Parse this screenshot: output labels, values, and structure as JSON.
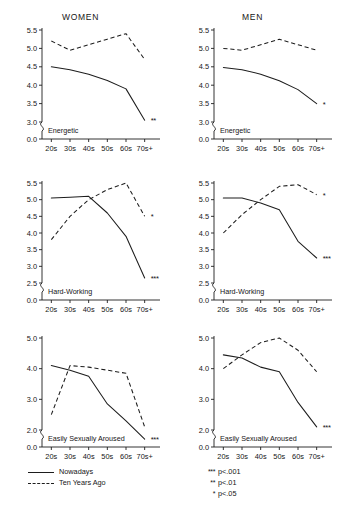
{
  "figure": {
    "column_titles": [
      "WOMEN",
      "MEN"
    ],
    "legend": [
      {
        "label": "Nowadays",
        "style": "solid"
      },
      {
        "label": "Ten Years Ago",
        "style": "dashed"
      }
    ],
    "significance_notes": [
      {
        "stars": "***",
        "label": "p<.001"
      },
      {
        "stars": "**",
        "label": "p<.01"
      },
      {
        "stars": "*",
        "label": "p<.05"
      }
    ]
  },
  "chart_data": [
    {
      "type": "line",
      "title": "WOMEN",
      "panel_label": "Energetic",
      "xlabel": "",
      "ylabel": "",
      "categories": [
        "20s",
        "30s",
        "40s",
        "50s",
        "60s",
        "70s+"
      ],
      "yticks": [
        "5.5",
        "5.0",
        "4.5",
        "4.0",
        "3.5",
        "3.0",
        "0.0"
      ],
      "ylim": [
        3.0,
        5.5
      ],
      "axis_break": true,
      "grid": false,
      "legend_position": "figure-bottom-left",
      "significance": "**",
      "series": [
        {
          "name": "Nowadays",
          "style": "solid",
          "values": [
            4.5,
            4.42,
            4.3,
            4.13,
            3.9,
            3.05
          ]
        },
        {
          "name": "Ten Years Ago",
          "style": "dashed",
          "values": [
            5.2,
            4.95,
            5.1,
            5.25,
            5.4,
            4.7
          ]
        }
      ]
    },
    {
      "type": "line",
      "title": "MEN",
      "panel_label": "Energetic",
      "xlabel": "",
      "ylabel": "",
      "categories": [
        "20s",
        "30s",
        "40s",
        "50s",
        "60s",
        "70s+"
      ],
      "yticks": [
        "5.5",
        "5.0",
        "4.5",
        "4.0",
        "3.5",
        "3.0",
        "0.0"
      ],
      "ylim": [
        3.0,
        5.5
      ],
      "axis_break": true,
      "grid": false,
      "legend_position": "figure-bottom-left",
      "significance": "*",
      "series": [
        {
          "name": "Nowadays",
          "style": "solid",
          "values": [
            4.48,
            4.42,
            4.3,
            4.12,
            3.88,
            3.5
          ]
        },
        {
          "name": "Ten Years Ago",
          "style": "dashed",
          "values": [
            5.0,
            4.95,
            5.1,
            5.25,
            5.1,
            4.95
          ]
        }
      ]
    },
    {
      "type": "line",
      "title": "WOMEN",
      "panel_label": "Hard-Working",
      "xlabel": "",
      "ylabel": "",
      "categories": [
        "20s",
        "30s",
        "40s",
        "50s",
        "60s",
        "70s+"
      ],
      "yticks": [
        "5.5",
        "5.0",
        "4.5",
        "4.0",
        "3.5",
        "3.0",
        "2.5",
        "0.0"
      ],
      "ylim": [
        2.5,
        5.5
      ],
      "axis_break": true,
      "grid": false,
      "legend_position": "figure-bottom-left",
      "significance": "***",
      "significance_dashed": "*",
      "series": [
        {
          "name": "Nowadays",
          "style": "solid",
          "values": [
            5.05,
            5.07,
            5.1,
            4.6,
            3.9,
            2.65
          ]
        },
        {
          "name": "Ten Years Ago",
          "style": "dashed",
          "values": [
            3.8,
            4.5,
            5.0,
            5.3,
            5.5,
            4.5
          ]
        }
      ]
    },
    {
      "type": "line",
      "title": "MEN",
      "panel_label": "Hard-Working",
      "xlabel": "",
      "ylabel": "",
      "categories": [
        "20s",
        "30s",
        "40s",
        "50s",
        "60s",
        "70s+"
      ],
      "yticks": [
        "5.5",
        "5.0",
        "4.5",
        "4.0",
        "3.5",
        "3.0",
        "2.5",
        "0.0"
      ],
      "ylim": [
        2.5,
        5.5
      ],
      "axis_break": true,
      "grid": false,
      "legend_position": "figure-bottom-left",
      "significance": "***",
      "significance_dashed": "*",
      "series": [
        {
          "name": "Nowadays",
          "style": "solid",
          "values": [
            5.05,
            5.05,
            4.9,
            4.7,
            3.75,
            3.25
          ]
        },
        {
          "name": "Ten Years Ago",
          "style": "dashed",
          "values": [
            4.0,
            4.55,
            5.0,
            5.4,
            5.45,
            5.15
          ]
        }
      ]
    },
    {
      "type": "line",
      "title": "WOMEN",
      "panel_label": "Easily Sexually Aroused",
      "xlabel": "",
      "ylabel": "",
      "categories": [
        "20s",
        "30s",
        "40s",
        "50s",
        "60s",
        "70s+"
      ],
      "yticks": [
        "5.0",
        "4.0",
        "3.0",
        "2.0",
        "0.0"
      ],
      "ylim": [
        2.0,
        5.0
      ],
      "axis_break": true,
      "grid": false,
      "legend_position": "figure-bottom-left",
      "significance": "***",
      "series": [
        {
          "name": "Nowadays",
          "style": "solid",
          "values": [
            4.1,
            3.95,
            3.75,
            2.85,
            2.3,
            1.7
          ]
        },
        {
          "name": "Ten Years Ago",
          "style": "dashed",
          "values": [
            2.5,
            4.1,
            4.05,
            3.95,
            3.85,
            2.1
          ]
        }
      ]
    },
    {
      "type": "line",
      "title": "MEN",
      "panel_label": "Easily Sexually Aroused",
      "xlabel": "",
      "ylabel": "",
      "categories": [
        "20s",
        "30s",
        "40s",
        "50s",
        "60s",
        "70s+"
      ],
      "yticks": [
        "5.0",
        "4.0",
        "3.0",
        "2.0",
        "0.0"
      ],
      "ylim": [
        2.0,
        5.0
      ],
      "axis_break": true,
      "grid": false,
      "legend_position": "figure-bottom-left",
      "significance": "***",
      "series": [
        {
          "name": "Nowadays",
          "style": "solid",
          "values": [
            4.45,
            4.35,
            4.05,
            3.9,
            2.9,
            2.1
          ]
        },
        {
          "name": "Ten Years Ago",
          "style": "dashed",
          "values": [
            4.0,
            4.45,
            4.85,
            5.0,
            4.6,
            3.9
          ]
        }
      ]
    }
  ]
}
